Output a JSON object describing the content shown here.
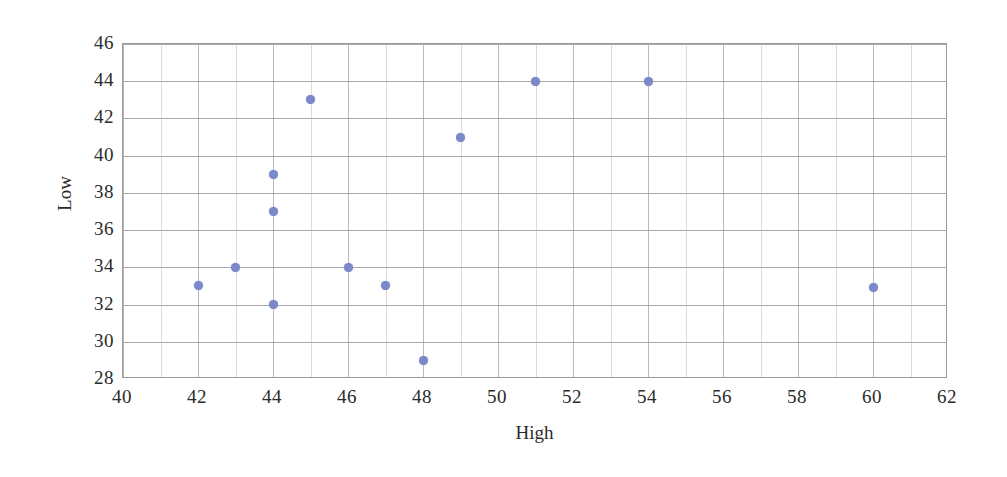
{
  "chart_data": {
    "type": "scatter",
    "title": "",
    "xlabel": "High",
    "ylabel": "Low",
    "xlim": [
      40,
      62
    ],
    "ylim": [
      28,
      46
    ],
    "x_ticks": [
      40,
      42,
      44,
      46,
      48,
      50,
      52,
      54,
      56,
      58,
      60,
      62
    ],
    "y_ticks": [
      28,
      30,
      32,
      34,
      36,
      38,
      40,
      42,
      44,
      46
    ],
    "x_tick_step": 2,
    "y_tick_step": 2,
    "x_gridline_step": 1,
    "y_gridline_step": 2,
    "grid": true,
    "legend": false,
    "marker": {
      "shape": "circle",
      "color": "#7b88c9",
      "size_px": 9
    },
    "series": [
      {
        "name": "Low vs High",
        "points": [
          {
            "x": 42,
            "y": 33
          },
          {
            "x": 43,
            "y": 34
          },
          {
            "x": 44,
            "y": 32
          },
          {
            "x": 44,
            "y": 37
          },
          {
            "x": 44,
            "y": 39
          },
          {
            "x": 45,
            "y": 43
          },
          {
            "x": 46,
            "y": 34
          },
          {
            "x": 47,
            "y": 33
          },
          {
            "x": 48,
            "y": 29
          },
          {
            "x": 49,
            "y": 41
          },
          {
            "x": 51,
            "y": 44
          },
          {
            "x": 54,
            "y": 44
          },
          {
            "x": 60,
            "y": 32.9
          }
        ]
      }
    ]
  },
  "colors": {
    "marker": "#7b88c9",
    "gridline_major": "#b9b9b9",
    "gridline_minor": "#dcdcdc",
    "axis_border": "#9a9a9a",
    "text": "#2b2b2b",
    "background": "#ffffff"
  }
}
